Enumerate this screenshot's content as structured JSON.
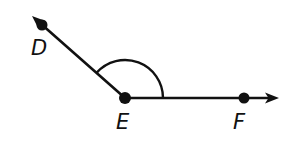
{
  "diagram": {
    "type": "angle",
    "angle_name": "DEF",
    "vertex": {
      "label": "E",
      "x": 125,
      "y": 98
    },
    "ray_ED": {
      "point": {
        "label": "D",
        "x": 42,
        "y": 25
      },
      "arrow_tip": {
        "x": 32,
        "y": 16
      }
    },
    "ray_EF": {
      "point": {
        "label": "F",
        "x": 244,
        "y": 98
      },
      "arrow_tip": {
        "x": 279,
        "y": 98
      }
    },
    "angle_arc": {
      "radius": 38
    },
    "labels": {
      "D": {
        "text": "D",
        "x": 31,
        "y": 38
      },
      "E": {
        "text": "E",
        "x": 116,
        "y": 112
      },
      "F": {
        "text": "F",
        "x": 233,
        "y": 112
      }
    },
    "colors": {
      "stroke": "#111111",
      "background": "#ffffff"
    }
  }
}
